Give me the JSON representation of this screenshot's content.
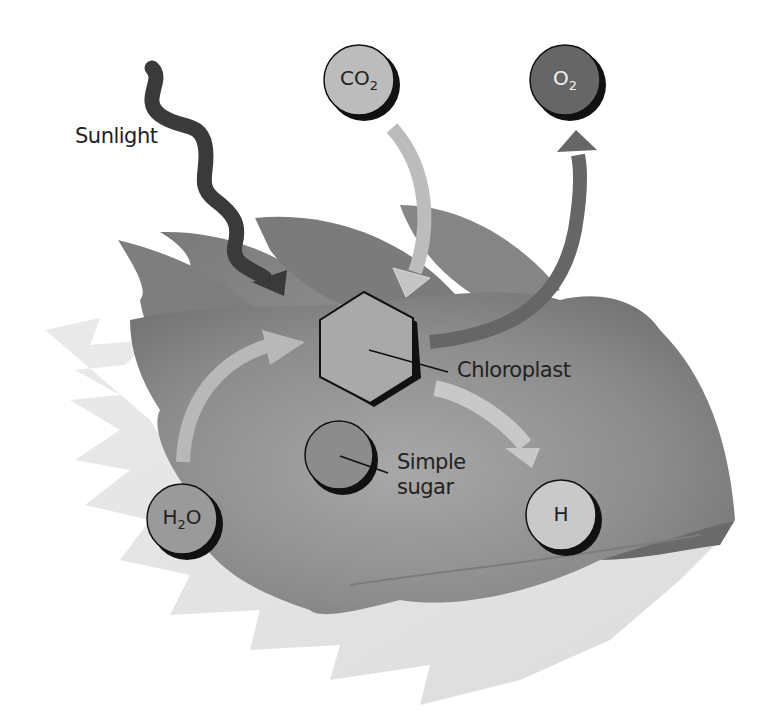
{
  "diagram": {
    "labels": {
      "sunlight": "Sunlight",
      "chloroplast": "Chloroplast",
      "simple_sugar_line1": "Simple",
      "simple_sugar_line2": "sugar"
    },
    "molecules": {
      "co2": {
        "base": "CO",
        "sub": "2"
      },
      "o2": {
        "base": "O",
        "sub": "2"
      },
      "h2o": {
        "base": "H",
        "sub": "2",
        "tail": "O"
      },
      "h": {
        "base": "H"
      }
    },
    "colors": {
      "leaf_back": "#e2e2e2",
      "leaf_main": "#8a8a8a",
      "leaf_dark": "#6f6f6f",
      "sunlight_arrow": "#3a3a3a",
      "co2_arrow": "#bdbdbd",
      "o2_arrow": "#666666",
      "h2o_arrow": "#b8b8b8",
      "h_arrow": "#c8c8c8",
      "co2_circle": "#bcbcbc",
      "o2_circle": "#666666",
      "h2o_circle": "#9a9a9a",
      "sugar_circle": "#8c8c8c",
      "h_circle": "#c9c9c9",
      "chloroplast_fill": "#a9a9a9"
    }
  }
}
